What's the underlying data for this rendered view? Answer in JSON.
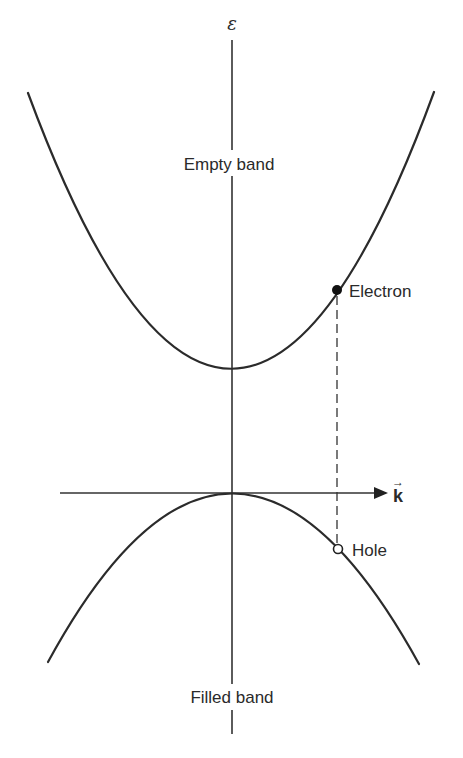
{
  "diagram": {
    "type": "band-structure",
    "axes": {
      "vertical_label": "ε",
      "horizontal_label": "k",
      "horizontal_label_has_vector_arrow": true
    },
    "bands": [
      {
        "name": "Empty band",
        "shape": "upward parabola",
        "role": "conduction"
      },
      {
        "name": "Filled band",
        "shape": "downward parabola",
        "role": "valence"
      }
    ],
    "labels": {
      "epsilon": "ε",
      "k": "k",
      "k_arrow": "→",
      "empty_band": "Empty band",
      "filled_band": "Filled band",
      "electron": "Electron",
      "hole": "Hole"
    },
    "points": [
      {
        "name": "Electron",
        "marker": "filled circle",
        "band": "Empty band"
      },
      {
        "name": "Hole",
        "marker": "open circle",
        "band": "Filled band"
      }
    ],
    "connector": "dashed vertical line joining electron and hole at the same k",
    "colors": {
      "line": "#2b2b2b",
      "text": "#2a2a2a",
      "background": "#ffffff"
    }
  }
}
